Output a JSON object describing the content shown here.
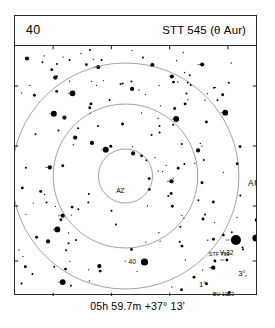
{
  "header": {
    "page_number": "40",
    "object_title": "STT 545 (θ Aur)"
  },
  "caption": "05h 59.7m  +37° 13'",
  "chart_data": {
    "type": "scatter",
    "subtitle": "05h 59.7m  +37° 13'",
    "xlabel": "",
    "ylabel": "",
    "grid": false,
    "legend": null,
    "projection": "equatorial finder chart, north up",
    "field_center": {
      "ra": "05h 59.7m",
      "dec": "+37° 13'"
    },
    "constellation_label": "AURIGA",
    "rings": [
      {
        "label": "1°",
        "radius_deg": 1,
        "cx": 63,
        "cy": 130,
        "r": 27
      },
      {
        "label": "3°",
        "radius_deg": 3,
        "cx": 63,
        "cy": 130,
        "r": 72
      },
      {
        "label": "5°",
        "radius_deg": 5,
        "cx": 63,
        "cy": 130,
        "r": 113
      }
    ],
    "ring_label_positions": [
      {
        "label": "1°",
        "x": 77,
        "y": 111
      },
      {
        "label": "3°",
        "x": 116,
        "y": 100
      },
      {
        "label": "5°",
        "x": 134,
        "y": 80
      },
      {
        "label": "AZ",
        "x": -5,
        "y": 17
      }
    ],
    "labeled_stars": [
      {
        "name": "θ-37",
        "x": 63,
        "y": 130,
        "mag_radius": 6.2,
        "label_dx": 9,
        "label_dy": 4,
        "label_size": "lg",
        "marker": "tick-both"
      },
      {
        "name": "V-32",
        "x": 110,
        "y": 64,
        "mag_radius": 5.0,
        "label_dx": -16,
        "label_dy": 15,
        "label_size": "md",
        "marker": "tick-left"
      },
      {
        "name": "T-29",
        "x": 130,
        "y": 62,
        "mag_radius": 3.6,
        "label_dx": 6,
        "label_dy": 2,
        "label_size": "md",
        "marker": "none"
      },
      {
        "name": "28",
        "x": 131,
        "y": 44,
        "mag_radius": 2.2,
        "label_dx": 5,
        "label_dy": 2,
        "label_size": "md",
        "marker": "none"
      },
      {
        "name": "U-31",
        "x": 113,
        "y": 129,
        "mag_radius": 3.8,
        "label_dx": 6,
        "label_dy": 3,
        "label_size": "md",
        "marker": "none"
      },
      {
        "name": "40",
        "x": 19,
        "y": 86,
        "mag_radius": 3.6,
        "label_dx": -16,
        "label_dy": 2,
        "label_size": "md",
        "marker": "none"
      },
      {
        "name": "SZ",
        "x": 155,
        "y": 72,
        "mag_radius": 1.4,
        "label_dx": -9,
        "label_dy": 2,
        "label_size": "md",
        "marker": "none"
      },
      {
        "name": "BU 1053",
        "x": 97,
        "y": 125,
        "mag_radius": 1.5,
        "label_dx": -10,
        "label_dy": -5,
        "label_size": "sm",
        "marker": "tick-left"
      },
      {
        "name": "STF 799",
        "x": 101,
        "y": 84,
        "mag_radius": 1.4,
        "label_dx": -18,
        "label_dy": -4,
        "label_size": "sm",
        "marker": "tick-left"
      },
      {
        "name": "STF 872",
        "x": -32,
        "y": 159,
        "mag_radius": 1.6,
        "label_dx": 5,
        "label_dy": 2,
        "label_size": "sm",
        "marker": "tick-left"
      },
      {
        "name": "AURIGA",
        "x": 140,
        "y": 10,
        "mag_radius": 0,
        "label_dx": 0,
        "label_dy": 0,
        "label_size": "con",
        "marker": "none"
      }
    ],
    "field_star_count": 186,
    "magnitude_scale": "dot area proportional to brightness"
  }
}
